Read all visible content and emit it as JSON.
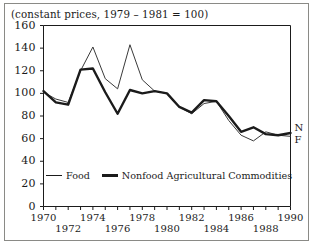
{
  "figure": {
    "subtitle": "(constant prices, 1979 – 1981 = 100)",
    "axis_color": "#1b1b1b",
    "frame_color": "#8a8a86",
    "end_label_food": "F",
    "end_label_nonfood": "N"
  },
  "legend": {
    "items": [
      {
        "label": "Food",
        "style": "thin"
      },
      {
        "label": "Nonfood Agricultural Commodities",
        "style": "thick"
      }
    ]
  },
  "chart_data": {
    "type": "line",
    "title": "",
    "subtitle": "(constant prices, 1979 – 1981 = 100)",
    "xlabel": "",
    "ylabel": "",
    "xlim": [
      1970,
      1990
    ],
    "ylim": [
      0,
      160
    ],
    "ytick_step": 20,
    "yticks": [
      0,
      20,
      40,
      60,
      80,
      100,
      120,
      140,
      160
    ],
    "xticks": [
      1970,
      1971,
      1972,
      1973,
      1974,
      1975,
      1976,
      1977,
      1978,
      1979,
      1980,
      1981,
      1982,
      1983,
      1984,
      1985,
      1986,
      1987,
      1988,
      1989,
      1990
    ],
    "xtick_labels_shown": [
      1970,
      1972,
      1974,
      1976,
      1978,
      1980,
      1982,
      1984,
      1986,
      1988,
      1990
    ],
    "xtick_label_stagger": true,
    "grid": false,
    "legend_position": "inside-bottom-left",
    "x": [
      1970,
      1971,
      1972,
      1973,
      1974,
      1975,
      1976,
      1977,
      1978,
      1979,
      1980,
      1981,
      1982,
      1983,
      1984,
      1985,
      1986,
      1987,
      1988,
      1989,
      1990
    ],
    "series": [
      {
        "name": "Food",
        "end_label": "F",
        "line_width": 1,
        "color": "#3a3a3a",
        "values": [
          101,
          95,
          92,
          120,
          141,
          113,
          104,
          143,
          112,
          102,
          100,
          88,
          82,
          91,
          93,
          76,
          63,
          58,
          66,
          63,
          62
        ]
      },
      {
        "name": "Nonfood Agricultural Commodities",
        "end_label": "N",
        "line_width": 2.4,
        "color": "#1b1b1b",
        "values": [
          102,
          92,
          90,
          121,
          122,
          101,
          82,
          103,
          100,
          102,
          100,
          88,
          83,
          94,
          93,
          80,
          66,
          70,
          64,
          63,
          65
        ]
      }
    ]
  }
}
